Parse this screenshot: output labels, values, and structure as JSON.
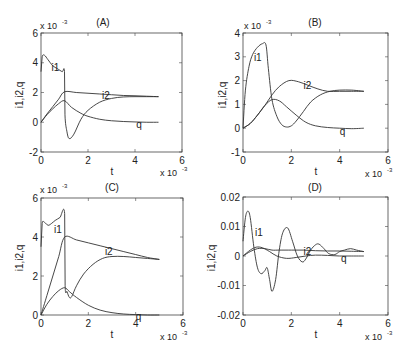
{
  "chart_data": [
    {
      "type": "line",
      "title": "(A)",
      "xlabel": "t",
      "ylabel": "i1,i2,q",
      "x_multiplier": "x 10^-3",
      "y_multiplier": "x 10^-3",
      "xlim": [
        0,
        6
      ],
      "ylim": [
        -2,
        6
      ],
      "xticks": [
        "0",
        "2",
        "4",
        "6"
      ],
      "yticks": [
        "-2",
        "0",
        "2",
        "4",
        "6"
      ],
      "grid": false,
      "series": [
        {
          "name": "i1",
          "x": [
            0,
            0.05,
            0.15,
            0.3,
            0.5,
            0.7,
            0.9,
            1.0,
            1.02,
            1.1,
            1.2,
            1.4,
            1.7,
            2.0,
            2.5,
            3.0,
            3.5,
            4.0,
            4.5,
            5.0
          ],
          "y": [
            3.4,
            4.4,
            4.5,
            4.2,
            3.8,
            3.6,
            3.4,
            3.4,
            0.5,
            -0.6,
            -1.1,
            -0.8,
            0.2,
            0.8,
            1.35,
            1.6,
            1.7,
            1.72,
            1.72,
            1.72
          ]
        },
        {
          "name": "i2",
          "x": [
            0,
            0.25,
            0.5,
            0.75,
            1.0,
            1.5,
            2.0,
            2.5,
            3.0,
            3.5,
            4.0,
            4.5,
            5.0
          ],
          "y": [
            0,
            0.55,
            1.05,
            1.55,
            2.05,
            2.0,
            1.95,
            1.9,
            1.85,
            1.8,
            1.78,
            1.75,
            1.72
          ]
        },
        {
          "name": "q",
          "x": [
            0,
            0.25,
            0.5,
            0.75,
            1.0,
            1.3,
            1.7,
            2.0,
            2.5,
            3.0,
            3.5,
            4.0,
            4.5,
            5.0
          ],
          "y": [
            0,
            0.5,
            0.9,
            1.25,
            1.45,
            1.0,
            0.6,
            0.4,
            0.2,
            0.1,
            0.05,
            0.02,
            0.0,
            0.0
          ]
        }
      ],
      "annotations": [
        {
          "text": "i1",
          "x": 0.45,
          "y": 3.7
        },
        {
          "text": "i2",
          "x": 2.6,
          "y": 1.8
        },
        {
          "text": "q",
          "x": 4.05,
          "y": -0.1
        }
      ]
    },
    {
      "type": "line",
      "title": "(B)",
      "xlabel": "t",
      "ylabel": "i1,i2,q",
      "x_multiplier": "x 10^-3",
      "y_multiplier": "x 10^-3",
      "xlim": [
        0,
        6
      ],
      "ylim": [
        -1,
        4
      ],
      "xticks": [
        "0",
        "2",
        "4",
        "6"
      ],
      "yticks": [
        "-1",
        "0",
        "1",
        "2",
        "3",
        "4"
      ],
      "grid": false,
      "series": [
        {
          "name": "i1",
          "x": [
            0,
            0.1,
            0.25,
            0.4,
            0.6,
            0.8,
            0.95,
            1.05,
            1.2,
            1.4,
            1.6,
            1.8,
            2.0,
            2.2,
            2.5,
            2.8,
            3.2,
            3.6,
            4.0,
            4.5,
            5.0
          ],
          "y": [
            0,
            1.6,
            2.6,
            3.1,
            3.4,
            3.55,
            3.5,
            2.5,
            1.2,
            0.5,
            0.15,
            0.05,
            0.1,
            0.3,
            0.7,
            1.1,
            1.4,
            1.55,
            1.6,
            1.6,
            1.55
          ]
        },
        {
          "name": "i2",
          "x": [
            0,
            0.3,
            0.6,
            0.9,
            1.2,
            1.5,
            1.9,
            2.3,
            2.7,
            3.1,
            3.5,
            4.0,
            4.5,
            5.0
          ],
          "y": [
            0,
            0.2,
            0.55,
            0.95,
            1.4,
            1.75,
            2.0,
            1.95,
            1.8,
            1.65,
            1.55,
            1.55,
            1.55,
            1.55
          ]
        },
        {
          "name": "q",
          "x": [
            0,
            0.3,
            0.6,
            0.9,
            1.2,
            1.5,
            1.8,
            2.2,
            2.6,
            3.0,
            3.5,
            4.0,
            4.5,
            5.0
          ],
          "y": [
            0,
            0.2,
            0.55,
            0.95,
            1.2,
            1.15,
            0.9,
            0.55,
            0.25,
            0.1,
            0.03,
            0.0,
            -0.02,
            0.0
          ]
        }
      ],
      "annotations": [
        {
          "text": "i1",
          "x": 0.45,
          "y": 3.0
        },
        {
          "text": "i2",
          "x": 2.5,
          "y": 1.8
        },
        {
          "text": "q",
          "x": 4.0,
          "y": -0.1
        }
      ]
    },
    {
      "type": "line",
      "title": "(C)",
      "xlabel": "t",
      "ylabel": "i1,i2,q",
      "x_multiplier": "x 10^-3",
      "y_multiplier": "x 10^-3",
      "xlim": [
        0,
        6
      ],
      "ylim": [
        0,
        6
      ],
      "xticks": [
        "0",
        "2",
        "4",
        "6"
      ],
      "yticks": [
        "0",
        "2",
        "4",
        "6"
      ],
      "grid": false,
      "series": [
        {
          "name": "i1",
          "x": [
            0,
            0.05,
            0.15,
            0.3,
            0.45,
            0.6,
            0.8,
            1.0,
            1.02,
            1.1,
            1.2,
            1.3,
            1.5,
            1.8,
            2.2,
            2.6,
            3.0,
            3.5,
            4.0,
            4.5,
            5.0
          ],
          "y": [
            3.5,
            4.7,
            4.75,
            4.6,
            4.7,
            4.85,
            5.0,
            5.2,
            1.5,
            1.2,
            0.9,
            0.95,
            1.5,
            2.1,
            2.6,
            2.9,
            3.0,
            3.0,
            2.95,
            2.9,
            2.85
          ]
        },
        {
          "name": "i2",
          "x": [
            0,
            0.25,
            0.5,
            0.75,
            1.0,
            1.5,
            2.0,
            2.5,
            3.0,
            3.5,
            4.0,
            4.5,
            5.0
          ],
          "y": [
            0,
            1.0,
            2.0,
            3.0,
            4.0,
            3.85,
            3.7,
            3.55,
            3.4,
            3.25,
            3.1,
            2.95,
            2.85
          ]
        },
        {
          "name": "q",
          "x": [
            0,
            0.25,
            0.5,
            0.75,
            1.0,
            1.2,
            1.5,
            2.0,
            2.5,
            3.0,
            3.5,
            4.0,
            4.5,
            5.0
          ],
          "y": [
            0,
            0.55,
            0.95,
            1.25,
            1.4,
            1.2,
            0.9,
            0.5,
            0.25,
            0.12,
            0.05,
            0.02,
            0.0,
            0.0
          ]
        }
      ],
      "annotations": [
        {
          "text": "i1",
          "x": 0.55,
          "y": 4.4
        },
        {
          "text": "i2",
          "x": 2.7,
          "y": 3.3
        },
        {
          "text": "q",
          "x": 4.0,
          "y": -0.05
        }
      ]
    },
    {
      "type": "line",
      "title": "(D)",
      "xlabel": "t",
      "ylabel": "i1,i2,q",
      "x_multiplier": "x 10^-3",
      "y_multiplier": "",
      "xlim": [
        0,
        6
      ],
      "ylim": [
        -0.02,
        0.02
      ],
      "xticks": [
        "0",
        "2",
        "4",
        "6"
      ],
      "yticks": [
        "-0.02",
        "-0.01",
        "0",
        "0.01",
        "0.02"
      ],
      "grid": false,
      "series": [
        {
          "name": "i1",
          "x": [
            0,
            0.1,
            0.2,
            0.3,
            0.45,
            0.6,
            0.75,
            0.9,
            1.0,
            1.1,
            1.2,
            1.35,
            1.5,
            1.65,
            1.85,
            2.05,
            2.25,
            2.45,
            2.6,
            2.8,
            3.0,
            3.15,
            3.35,
            3.55,
            3.8,
            4.0,
            4.2,
            4.45,
            4.7,
            5.0
          ],
          "y": [
            0.005,
            0.013,
            0.0152,
            0.013,
            0.003,
            -0.004,
            -0.006,
            -0.005,
            -0.004,
            -0.008,
            -0.012,
            -0.008,
            0.002,
            0.008,
            0.0095,
            0.005,
            0.0,
            -0.002,
            -0.001,
            0.002,
            0.0038,
            0.004,
            0.0025,
            0.0008,
            0.0005,
            0.0015,
            0.002,
            0.0025,
            0.002,
            0.0015
          ]
        },
        {
          "name": "i2",
          "x": [
            0,
            0.3,
            0.6,
            0.9,
            1.2,
            1.5,
            2.0,
            2.5,
            3.0,
            3.5,
            4.0,
            4.5,
            5.0
          ],
          "y": [
            0,
            0.0015,
            0.0025,
            0.0025,
            0.002,
            0.002,
            0.002,
            0.002,
            0.0018,
            0.0017,
            0.0017,
            0.0016,
            0.0015
          ]
        },
        {
          "name": "q",
          "x": [
            0,
            0.3,
            0.55,
            0.8,
            1.1,
            1.4,
            1.8,
            2.2,
            2.6,
            3.0,
            3.5,
            4.0,
            4.5,
            5.0
          ],
          "y": [
            0,
            0.002,
            0.003,
            0.0028,
            0.0015,
            0.0,
            -0.0008,
            -0.0005,
            0.0,
            0.0003,
            0.0002,
            0.0,
            0.0,
            0.0
          ]
        }
      ],
      "annotations": [
        {
          "text": "i1",
          "x": 0.5,
          "y": 0.008
        },
        {
          "text": "i2",
          "x": 2.5,
          "y": 0.0018
        },
        {
          "text": "q",
          "x": 4.05,
          "y": -0.0008
        }
      ]
    }
  ],
  "panels": [
    {
      "title": "(A)",
      "xlabel": "t",
      "ylabel": "i1,i2,q",
      "y_mult_base": "x 10",
      "y_mult_exp": "-3",
      "x_mult_base": "x 10",
      "x_mult_exp": "-3"
    },
    {
      "title": "(B)",
      "xlabel": "t",
      "ylabel": "i1,i2,q",
      "y_mult_base": "x 10",
      "y_mult_exp": "-3",
      "x_mult_base": "x 10",
      "x_mult_exp": "-3"
    },
    {
      "title": "(C)",
      "xlabel": "t",
      "ylabel": "i1,i2,q",
      "y_mult_base": "x 10",
      "y_mult_exp": "-3",
      "x_mult_base": "x 10",
      "x_mult_exp": "-3"
    },
    {
      "title": "(D)",
      "xlabel": "t",
      "ylabel": "i1,i2,q",
      "y_mult_base": "",
      "y_mult_exp": "",
      "x_mult_base": "x 10",
      "x_mult_exp": "-3"
    }
  ]
}
